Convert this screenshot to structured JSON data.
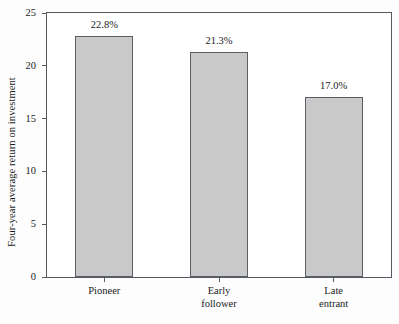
{
  "chart_data": {
    "type": "bar",
    "title": "",
    "subtitle": "",
    "xlabel": "",
    "ylabel": "Four-year average return on investment",
    "categories": [
      "Pioneer",
      "Early follower",
      "Late entrant"
    ],
    "category_lines": [
      [
        "Pioneer"
      ],
      [
        "Early",
        "follower"
      ],
      [
        "Late",
        "entrant"
      ]
    ],
    "values": [
      22.8,
      21.3,
      17.0
    ],
    "data_labels": [
      "22.8%",
      "21.3%",
      "17.0%"
    ],
    "ylim": [
      0,
      25
    ],
    "yticks": [
      0,
      5,
      10,
      15,
      20,
      25
    ],
    "ytick_labels": [
      "0",
      "5",
      "10",
      "15",
      "20",
      "25"
    ],
    "grid": false,
    "legend": null,
    "legend_position": "none",
    "bar_fill_color": "#c9c9c9",
    "bar_edge_color": "#5a5f65",
    "axis_color": "#555a60",
    "background_color": "#ffffff"
  }
}
